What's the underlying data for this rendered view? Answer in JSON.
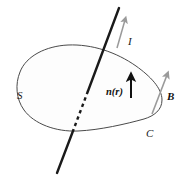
{
  "figure": {
    "kind": "physics-diagram",
    "background_color": "#ffffff",
    "canvas": {
      "width": 186,
      "height": 176
    }
  },
  "labels": {
    "surface": "S",
    "curve": "C",
    "current": "I",
    "normal": "n(r)",
    "field": "B"
  },
  "colors": {
    "outline": "#4a4a4a",
    "wire": "#1a1a1a",
    "normal_arrow": "#111111",
    "field_arrow": "#9a9a9a",
    "current_arrow": "#9a9a9a",
    "surface_fill": "#fdfdfd",
    "label_text": "#1a1a1a"
  },
  "elements": {
    "surface_outline": {
      "name": "S",
      "stroke_width": 1
    },
    "wire": {
      "name": "I",
      "solid_upper": {
        "x1": 119,
        "y1": 8,
        "x2": 88,
        "y2": 91
      },
      "dashed_middle": {
        "x1": 88,
        "y1": 91,
        "x2": 73,
        "y2": 131
      },
      "solid_lower": {
        "x1": 73,
        "y1": 131,
        "x2": 57,
        "y2": 172
      },
      "stroke_width": 2.4
    },
    "current_arrow": {
      "from": [
        117,
        47
      ],
      "to": [
        125,
        18
      ]
    },
    "normal_arrow": {
      "from": [
        131,
        97
      ],
      "to": [
        131,
        76
      ]
    },
    "field_arrow": {
      "from": [
        152,
        113
      ],
      "to": [
        168,
        74
      ]
    }
  }
}
